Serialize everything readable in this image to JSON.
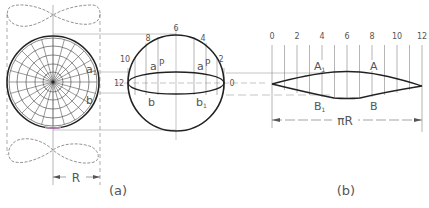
{
  "figure": {
    "panel_a": {
      "caption": "(a)",
      "dimension_label": "R",
      "polar_view_labels": {
        "a1": "a",
        "a1_sub": "1",
        "b": "b"
      },
      "sphere_labels": {
        "meridian_numbers": [
          "12",
          "10",
          "8",
          "6",
          "4",
          "2",
          "0"
        ],
        "point_a": "a",
        "point_a_P": "P",
        "point_a1": "a",
        "point_a1_sub": "1",
        "point_a1_P": "P",
        "point_b": "b",
        "point_b1": "b",
        "point_b1_sub": "1"
      }
    },
    "panel_b": {
      "caption": "(b)",
      "tick_labels": [
        "0",
        "2",
        "4",
        "6",
        "8",
        "10",
        "12"
      ],
      "point_A1": "A",
      "point_A1_sub": "1",
      "point_A": "A",
      "point_B1": "B",
      "point_B1_sub": "1",
      "point_B": "B",
      "dimension_label": "πR"
    }
  },
  "colors": {
    "line": "#333333",
    "thin": "#666666",
    "text": "#555555",
    "accent": "#c080c0"
  }
}
